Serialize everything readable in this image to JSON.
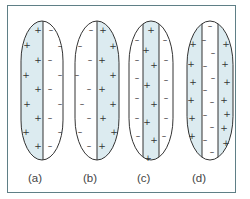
{
  "figure": {
    "frame_color": "#5f7f86",
    "fill_color": "#dcebf0",
    "outline_color": "#333333",
    "cells": [
      {
        "id": "a",
        "label": "(a)",
        "cx": 42,
        "top": 21,
        "bottom": 160,
        "rx": 21,
        "lines": [
          43
        ],
        "shaded": [
          [
            21,
            43
          ]
        ],
        "plus": [
          [
            38,
            30
          ],
          [
            27,
            45
          ],
          [
            38,
            60
          ],
          [
            26,
            75
          ],
          [
            38,
            89
          ],
          [
            27,
            104
          ],
          [
            38,
            118
          ],
          [
            26,
            132
          ],
          [
            38,
            146
          ]
        ],
        "minus": [
          [
            51,
            30
          ],
          [
            60,
            46
          ],
          [
            50,
            60
          ],
          [
            60,
            75
          ],
          [
            50,
            89
          ],
          [
            60,
            104
          ],
          [
            50,
            118
          ],
          [
            60,
            132
          ],
          [
            50,
            146
          ]
        ]
      },
      {
        "id": "b",
        "label": "(b)",
        "cx": 97,
        "top": 21,
        "bottom": 160,
        "rx": 22,
        "lines": [
          97
        ],
        "shaded": [
          [
            97,
            119
          ]
        ],
        "plus": [
          [
            103,
            30
          ],
          [
            113,
            46
          ],
          [
            102,
            60
          ],
          [
            113,
            75
          ],
          [
            102,
            89
          ],
          [
            113,
            104
          ],
          [
            103,
            118
          ],
          [
            114,
            132
          ],
          [
            102,
            146
          ]
        ],
        "minus": [
          [
            91,
            30
          ],
          [
            80,
            46
          ],
          [
            90,
            60
          ],
          [
            77,
            75
          ],
          [
            89,
            89
          ],
          [
            82,
            104
          ],
          [
            89,
            118
          ],
          [
            80,
            132
          ],
          [
            89,
            146
          ]
        ]
      },
      {
        "id": "c",
        "label": "(c)",
        "cx": 151,
        "top": 21,
        "bottom": 160,
        "rx": 22,
        "lines": [
          143,
          159
        ],
        "shaded": [
          [
            143,
            159
          ]
        ],
        "plus": [
          [
            151,
            30
          ],
          [
            146,
            50
          ],
          [
            154,
            65
          ],
          [
            147,
            85
          ],
          [
            154,
            104
          ],
          [
            147,
            122
          ],
          [
            154,
            140
          ],
          [
            148,
            158
          ]
        ],
        "minus": [
          [
            137,
            40
          ],
          [
            165,
            40
          ],
          [
            137,
            60
          ],
          [
            166,
            60
          ],
          [
            137,
            78
          ],
          [
            166,
            80
          ],
          [
            137,
            98
          ],
          [
            166,
            98
          ],
          [
            137,
            118
          ],
          [
            166,
            118
          ],
          [
            138,
            136
          ],
          [
            164,
            136
          ]
        ]
      },
      {
        "id": "d",
        "label": "(d)",
        "cx": 210,
        "top": 21,
        "bottom": 160,
        "rx": 23,
        "lines": [
          202,
          218
        ],
        "shaded": [
          [
            187,
            202
          ],
          [
            218,
            233
          ]
        ],
        "plus": [
          [
            193,
            44
          ],
          [
            191,
            64
          ],
          [
            193,
            82
          ],
          [
            191,
            100
          ],
          [
            192,
            118
          ],
          [
            192,
            136
          ],
          [
            226,
            44
          ],
          [
            225,
            64
          ],
          [
            227,
            82
          ],
          [
            224,
            100
          ],
          [
            227,
            114
          ],
          [
            224,
            128
          ],
          [
            226,
            143
          ]
        ],
        "minus": [
          [
            210,
            26
          ],
          [
            204,
            40
          ],
          [
            213,
            53
          ],
          [
            205,
            66
          ],
          [
            213,
            78
          ],
          [
            205,
            90
          ],
          [
            212,
            102
          ],
          [
            205,
            115
          ],
          [
            212,
            127
          ],
          [
            205,
            140
          ],
          [
            212,
            152
          ]
        ]
      }
    ]
  }
}
